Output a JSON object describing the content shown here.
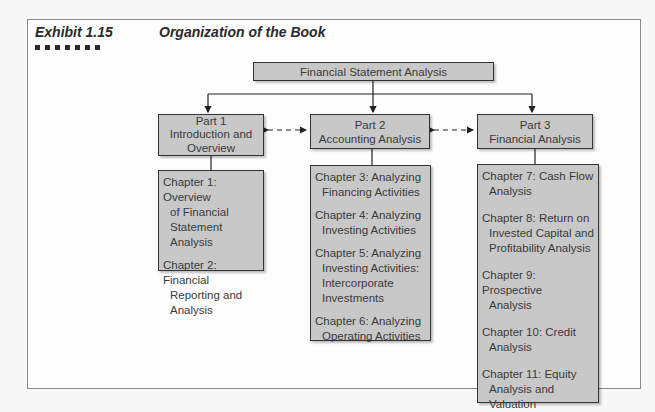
{
  "header": {
    "exhibit_label": "Exhibit 1.15",
    "title": "Organization of the Book",
    "decoration_squares": 7
  },
  "diagram": {
    "root": {
      "label": "Financial Statement Analysis"
    },
    "parts": [
      {
        "number": "Part 1",
        "name_line1": "Introduction and",
        "name_line2": "Overview",
        "chapters": [
          {
            "line1": "Chapter 1: Overview",
            "cont": [
              "of Financial",
              "Statement Analysis"
            ]
          },
          {
            "line1": "Chapter 2: Financial",
            "cont": [
              "Reporting and",
              "Analysis"
            ]
          }
        ]
      },
      {
        "number": "Part 2",
        "name_line1": "Accounting Analysis",
        "chapters": [
          {
            "line1": "Chapter 3: Analyzing",
            "cont": [
              "Financing Activities"
            ]
          },
          {
            "line1": "Chapter 4: Analyzing",
            "cont": [
              "Investing Activities"
            ]
          },
          {
            "line1": "Chapter 5: Analyzing",
            "cont": [
              "Investing Activities:",
              "Intercorporate",
              "Investments"
            ]
          },
          {
            "line1": "Chapter 6: Analyzing",
            "cont": [
              "Operating Activities"
            ]
          }
        ]
      },
      {
        "number": "Part 3",
        "name_line1": "Financial Analysis",
        "chapters": [
          {
            "line1": "Chapter 7: Cash Flow",
            "cont": [
              "Analysis"
            ]
          },
          {
            "line1": "Chapter 8: Return on",
            "cont": [
              "Invested Capital and",
              "Profitability Analysis"
            ]
          },
          {
            "line1": "Chapter 9: Prospective",
            "cont": [
              "Analysis"
            ]
          },
          {
            "line1": "Chapter 10: Credit",
            "cont": [
              "Analysis"
            ]
          },
          {
            "line1": "Chapter 11: Equity",
            "cont": [
              "Analysis and Valuation"
            ]
          }
        ]
      }
    ],
    "connections": [
      {
        "from": "Financial Statement Analysis",
        "to": "Part 1",
        "style": "solid-arrow"
      },
      {
        "from": "Financial Statement Analysis",
        "to": "Part 2",
        "style": "solid-arrow"
      },
      {
        "from": "Financial Statement Analysis",
        "to": "Part 3",
        "style": "solid-arrow"
      },
      {
        "from": "Part 1",
        "to": "Part 2",
        "style": "dashed-bidirectional"
      },
      {
        "from": "Part 2",
        "to": "Part 3",
        "style": "dashed-bidirectional"
      }
    ]
  },
  "colors": {
    "box_fill": "#c8c8c8",
    "box_border": "#333333",
    "text": "#3a3a3a",
    "frame_border": "#8a8a8a"
  }
}
